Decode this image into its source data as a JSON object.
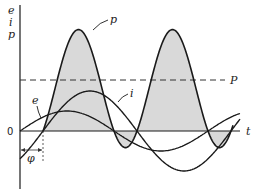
{
  "figure": {
    "labels": {
      "y_axis": [
        "e",
        "i",
        "p"
      ],
      "origin": "0",
      "t_axis": "t",
      "power_curve": "p",
      "voltage_curve": "e",
      "current_curve": "i",
      "average_power": "P",
      "phase_angle": "φ"
    },
    "colors": {
      "line": "#1a1a1a",
      "fill": "#d9d9d9",
      "dashed": "#333333"
    }
  },
  "chart_data": {
    "type": "line",
    "title": "",
    "xlabel": "t",
    "ylabel": "e, i, p",
    "grid": false,
    "series": [
      {
        "name": "e",
        "kind": "sinusoid",
        "amplitude": 0.5,
        "phase_deg": 0,
        "note": "voltage"
      },
      {
        "name": "i",
        "kind": "sinusoid",
        "amplitude": 1.0,
        "phase_deg": -44,
        "note": "current, lags e by φ"
      },
      {
        "name": "p",
        "kind": "product e·i",
        "shaded": true,
        "note": "instantaneous power, double frequency"
      },
      {
        "name": "P",
        "kind": "constant",
        "style": "dashed",
        "note": "average power"
      }
    ],
    "x_range_cycles": [
      0,
      1.15
    ],
    "annotations": [
      "φ (phase lag between e and i)"
    ]
  }
}
